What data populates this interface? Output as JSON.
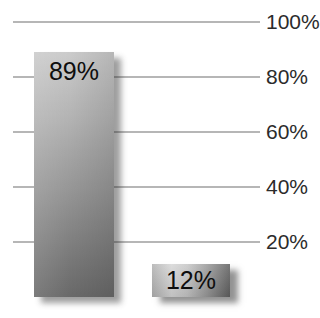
{
  "chart_data": {
    "type": "bar",
    "values": [
      89,
      12
    ],
    "data_labels": [
      "89%",
      "12%"
    ],
    "y_ticks": [
      "100%",
      "80%",
      "60%",
      "40%",
      "20%"
    ],
    "ylim": [
      0,
      100
    ],
    "y_tick_interval": 20,
    "y_tick_side": "right",
    "grid": true,
    "legend": false,
    "title": "",
    "xlabel": "",
    "ylabel": "",
    "colors": {
      "background": "#ffffff",
      "gridline": "#b6b6b6",
      "tick_label": "#2b2b2b",
      "bar_label": "#0e0e0e",
      "bar_gradient_light": "#d7d7d7",
      "bar_gradient_dark": "#606060"
    }
  }
}
